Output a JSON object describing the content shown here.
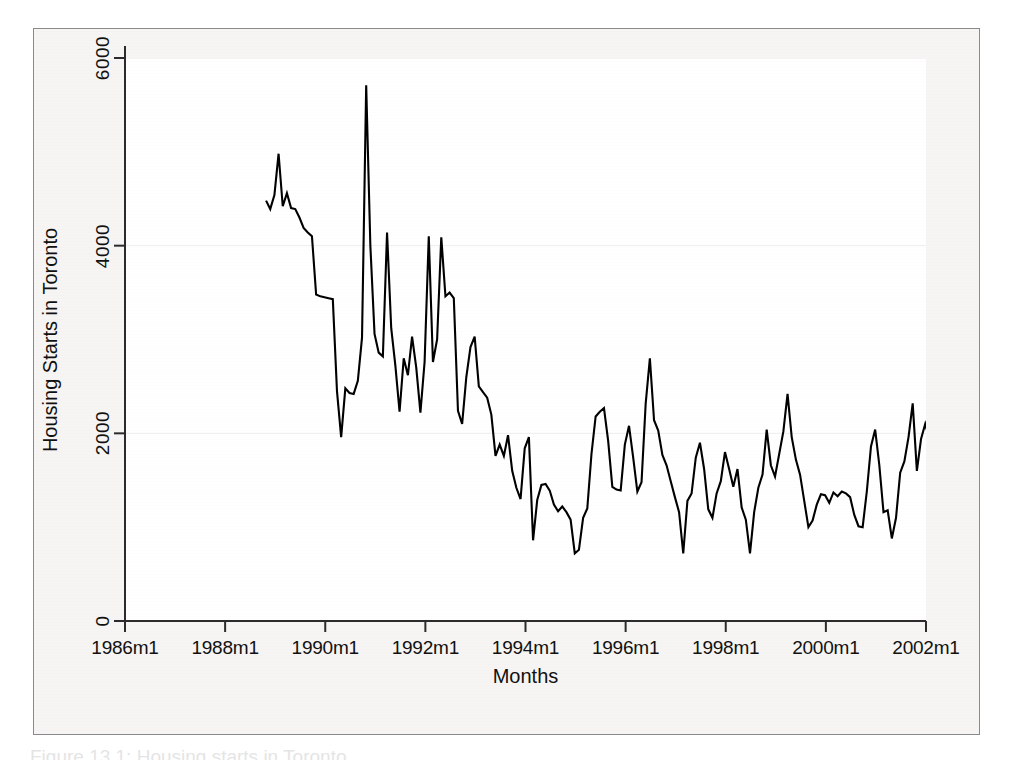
{
  "figure": {
    "background_color": "#f6f5f3",
    "plot_background_color": "#ffffff",
    "frame_color": "#8a8a8a",
    "line_color": "#000000",
    "gridline_color": "#eeeeee",
    "caption": "Figure 13.1: Housing starts in Toronto"
  },
  "chart_data": {
    "type": "line",
    "title": "",
    "subtitle": "",
    "xlabel": "Months",
    "ylabel": "Housing Starts in Toronto",
    "xlim": [
      1986.0,
      2002.0
    ],
    "ylim": [
      0,
      6400
    ],
    "ytick_values": [
      0,
      2000,
      4000,
      6000
    ],
    "ytick_labels": [
      "0",
      "2000",
      "4000",
      "6000"
    ],
    "xtick_values": [
      1986,
      1988,
      1990,
      1992,
      1994,
      1996,
      1998,
      2000,
      2002
    ],
    "xtick_labels": [
      "1986m1",
      "1988m1",
      "1990m1",
      "1992m1",
      "1994m1",
      "1996m1",
      "1998m1",
      "2000m1",
      "2002m1"
    ],
    "grid": true,
    "grid_axis": "y",
    "legend": false,
    "legend_position": "none",
    "series": [
      {
        "name": "Housing Starts in Toronto",
        "color": "#000000",
        "x_start": 1987.0,
        "x_step": 0.08333333,
        "x_unit": "month",
        "values": [
          4480,
          4390,
          4540,
          4980,
          4420,
          4560,
          4400,
          4390,
          4300,
          4190,
          4140,
          4100,
          3480,
          3460,
          3450,
          3440,
          3430,
          2450,
          1960,
          2480,
          2430,
          2420,
          2560,
          3020,
          5710,
          4000,
          3060,
          2860,
          2820,
          4140,
          3120,
          2720,
          2230,
          2800,
          2620,
          3030,
          2700,
          2220,
          2760,
          4100,
          2760,
          3000,
          4090,
          3460,
          3500,
          3440,
          2240,
          2100,
          2600,
          2920,
          3030,
          2500,
          2440,
          2380,
          2200,
          1760,
          1880,
          1760,
          1980,
          1600,
          1420,
          1300,
          1840,
          1960,
          860,
          1290,
          1450,
          1460,
          1390,
          1240,
          1170,
          1220,
          1160,
          1080,
          720,
          760,
          1100,
          1200,
          1780,
          2180,
          2230,
          2270,
          1920,
          1430,
          1400,
          1390,
          1880,
          2080,
          1740,
          1380,
          1480,
          2320,
          2800,
          2140,
          2030,
          1770,
          1660,
          1490,
          1320,
          1160,
          720,
          1280,
          1360,
          1740,
          1900,
          1620,
          1190,
          1100,
          1360,
          1490,
          1800,
          1620,
          1430,
          1620,
          1210,
          1080,
          720,
          1160,
          1420,
          1560,
          2040,
          1660,
          1540,
          1780,
          2020,
          2420,
          1960,
          1720,
          1560,
          1280,
          1000,
          1070,
          1240,
          1350,
          1340,
          1260,
          1370,
          1330,
          1380,
          1360,
          1320,
          1130,
          1010,
          1000,
          1380,
          1860,
          2040,
          1660,
          1160,
          1180,
          880,
          1100,
          1580,
          1700,
          1960,
          2320,
          1600,
          1940,
          2100,
          1940,
          1720,
          2600,
          2280,
          2020,
          2380,
          2470,
          2400,
          2050,
          1860,
          1480,
          2090,
          2240,
          2780,
          2040,
          2300,
          1300,
          1900,
          2380,
          2400,
          2260,
          2450,
          1550,
          2080,
          2600,
          2500,
          2700,
          4010,
          3440,
          2890,
          2780,
          3070,
          2450,
          2600,
          3780,
          3290,
          2470,
          1850,
          4310,
          3300,
          2460,
          3100,
          4460,
          3320,
          4080,
          4170,
          3180,
          3000,
          3150,
          3470,
          2840,
          2250,
          2280,
          3700,
          3900,
          3880
        ]
      }
    ],
    "notes": {
      "data_start_label": "1987m1",
      "data_end_label": "2001m7",
      "peak_value": 5710,
      "peak_label": "1989m1",
      "trough_value": 720
    }
  },
  "axes": {
    "y_title": "Housing Starts in Toronto",
    "x_title": "Months"
  }
}
